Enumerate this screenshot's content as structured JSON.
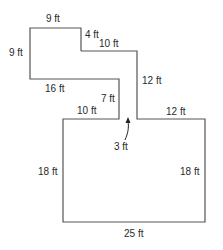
{
  "diagram": {
    "type": "floor-plan",
    "line_color": "#555555",
    "text_color": "#2a2a2a",
    "labels": {
      "top_left_width": "9 ft",
      "left_height": "9 ft",
      "step_down": "4 ft",
      "upper_corridor_width": "10 ft",
      "lower_left_width": "16 ft",
      "corridor_right_height": "12 ft",
      "inner_vertical": "7 ft",
      "inner_horizontal": "10 ft",
      "right_ledge_width": "12 ft",
      "gap": "3 ft",
      "big_left_height": "18 ft",
      "big_right_height": "18 ft",
      "bottom_width": "25 ft"
    }
  }
}
